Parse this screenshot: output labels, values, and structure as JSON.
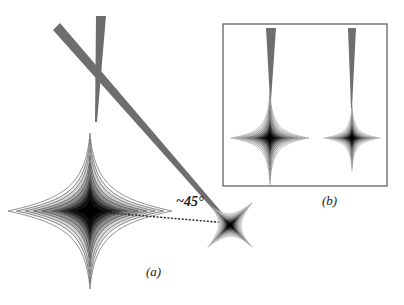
{
  "figure": {
    "panel_a": {
      "label": "(a)",
      "angle_label": "~45°",
      "beams": [
        {
          "name": "vertical-beam",
          "from": [
            99,
            15
          ],
          "to": [
            96,
            120
          ]
        },
        {
          "name": "diagonal-beam",
          "from": [
            57,
            27
          ],
          "to": [
            228,
            222
          ]
        }
      ],
      "patterns": [
        {
          "name": "large-star-pattern",
          "cx": 90,
          "cy": 211,
          "rotation": 0
        },
        {
          "name": "tilted-star-pattern",
          "cx": 230,
          "cy": 225,
          "rotation": 45
        }
      ]
    },
    "panel_b": {
      "label": "(b)",
      "box": {
        "x": 223,
        "y": 24,
        "w": 164,
        "h": 162
      },
      "patterns": [
        {
          "name": "inset-star-left",
          "cx": 270,
          "cy": 138
        },
        {
          "name": "inset-star-right",
          "cx": 352,
          "cy": 138
        }
      ]
    },
    "colors": {
      "beam": "#6e6e6e",
      "contour": "#111111",
      "frame": "#555555"
    }
  }
}
